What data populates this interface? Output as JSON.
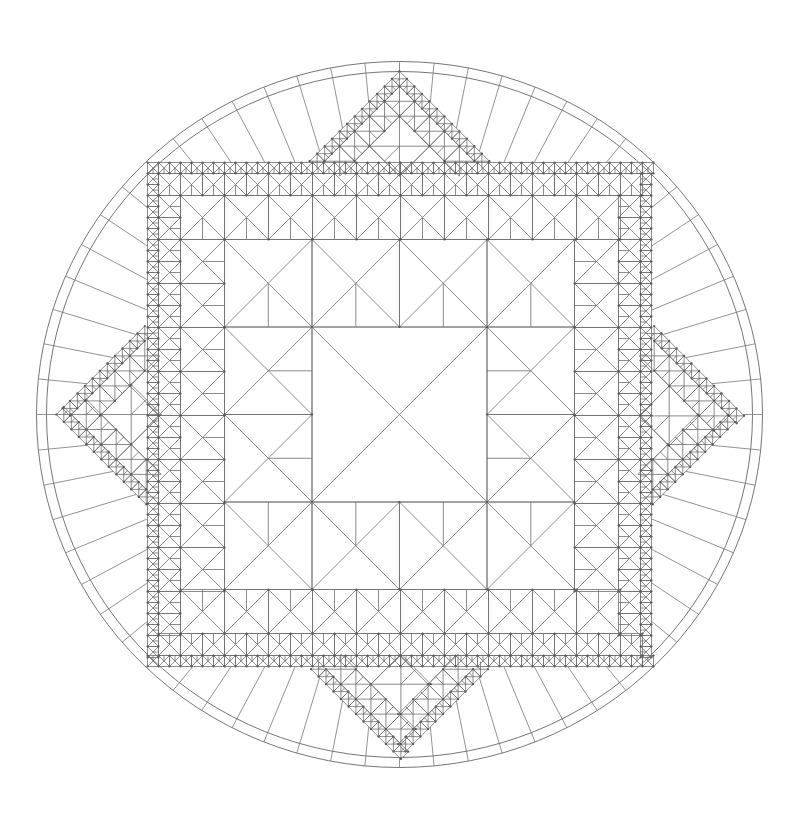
{
  "figure": {
    "title": "Recursive square-and-diamond tiling inside a ringed circle",
    "background": "#ffffff",
    "line_color": "#6e6e6e",
    "node_color": "#555555"
  },
  "geometry": {
    "center": [
      399.5,
      414.5
    ],
    "outer_circle_radius": [
      363,
      353
    ],
    "inner_circle_radius": [
      353,
      343
    ],
    "square_half_sizes": [
      87.5,
      175,
      219,
      241,
      252
    ],
    "diamond_scale": 0.963,
    "spoke_count": 64
  }
}
